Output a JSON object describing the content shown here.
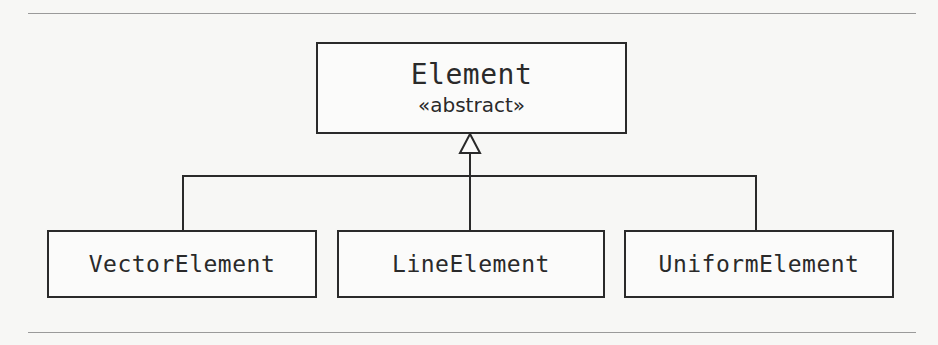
{
  "diagram": {
    "type": "uml-class-inheritance",
    "parent": {
      "name": "Element",
      "stereotype": "«abstract»"
    },
    "children": [
      {
        "name": "VectorElement"
      },
      {
        "name": "LineElement"
      },
      {
        "name": "UniformElement"
      }
    ],
    "relationship": "generalization",
    "colors": {
      "stroke": "#2a2a2a",
      "background": "#f7f7f5",
      "rule": "#9a9a9a"
    }
  }
}
